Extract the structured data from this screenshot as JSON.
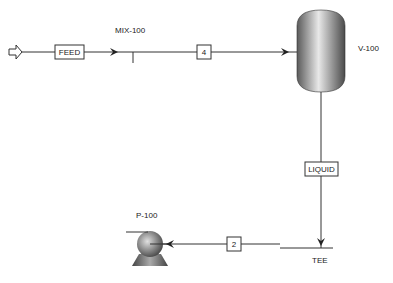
{
  "diagram": {
    "type": "process-flow-diagram",
    "units": [
      {
        "id": "MIX-100",
        "type": "mixer"
      },
      {
        "id": "V-100",
        "type": "vessel"
      },
      {
        "id": "TEE",
        "type": "tee"
      },
      {
        "id": "P-100",
        "type": "pump"
      }
    ],
    "streams": [
      {
        "label": "FEED"
      },
      {
        "label": "4"
      },
      {
        "label": "LIQUID"
      },
      {
        "label": "2"
      }
    ],
    "labels": {
      "mixer": "MIX-100",
      "vessel": "V-100",
      "tee": "TEE",
      "pump": "P-100"
    }
  }
}
